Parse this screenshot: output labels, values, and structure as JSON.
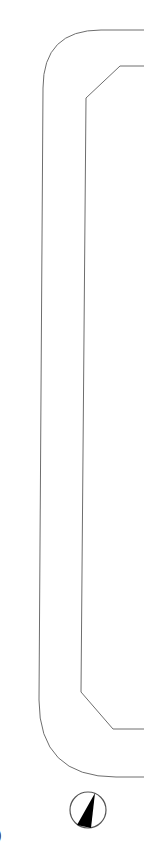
{
  "diagram": {
    "type": "floor-plan-fragment",
    "stroke_color": "#6e6e6e",
    "background": "#ffffff",
    "outer_outline": {
      "shape": "rounded-rectangle",
      "description": "outer rounded boundary (partially visible, extends to right edge)"
    },
    "inner_outline": {
      "shape": "chamfered-rectangle",
      "description": "inner chamfered boundary (partially visible, extends to right edge)"
    },
    "north_arrow": {
      "label": "north-arrow",
      "fill": "#000000"
    },
    "edge_glyph": ")"
  }
}
